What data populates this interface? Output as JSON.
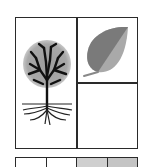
{
  "diagram": {
    "panels": [
      {
        "id": "left",
        "content": "tree-with-roots-icon"
      },
      {
        "id": "top-right",
        "content": "leaf-icon"
      },
      {
        "id": "bottom-right",
        "content": "empty"
      }
    ],
    "strip": {
      "cells": [
        {
          "fill": "#ffffff"
        },
        {
          "fill": "#ffffff"
        },
        {
          "fill": "#cfcfcf"
        },
        {
          "fill": "#c4c4c4"
        }
      ]
    },
    "colors": {
      "line": "#2a2a2a",
      "canopy": "#a8a8a8",
      "leaf_dark": "#7a7a7a",
      "leaf_light": "#a9a9a9"
    }
  }
}
